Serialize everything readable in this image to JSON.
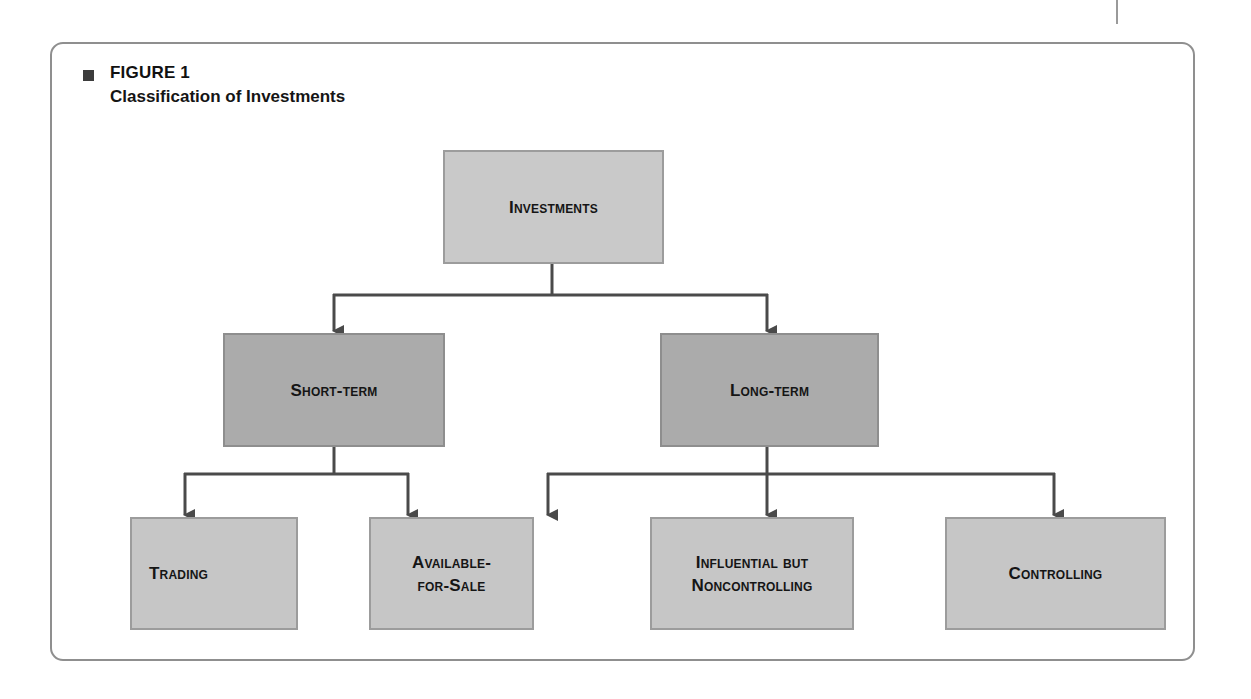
{
  "figure": {
    "label": "FIGURE 1",
    "title": "Classification of Investments"
  },
  "nodes": {
    "root": {
      "label": "Investments"
    },
    "short_term": {
      "label": "Short-term"
    },
    "long_term": {
      "label": "Long-term"
    },
    "trading": {
      "label": "Trading"
    },
    "available_for_sale": {
      "line1": "Available-",
      "line2": "for-Sale"
    },
    "influential": {
      "line1": "Influential but",
      "line2": "Noncontrolling"
    },
    "controlling": {
      "label": "Controlling"
    }
  },
  "hierarchy": {
    "Investments": [
      "Short-term",
      "Long-term"
    ],
    "Short-term": [
      "Trading",
      "Available-for-Sale"
    ],
    "Long-term": [
      "Available-for-Sale",
      "Influential but Noncontrolling",
      "Controlling"
    ]
  },
  "colors": {
    "root_fill": "#c9c9c9",
    "mid_fill": "#ababab",
    "leaf_fill": "#c6c6c6",
    "connector": "#4a4a4a",
    "frame_border": "#8f8f8f"
  }
}
